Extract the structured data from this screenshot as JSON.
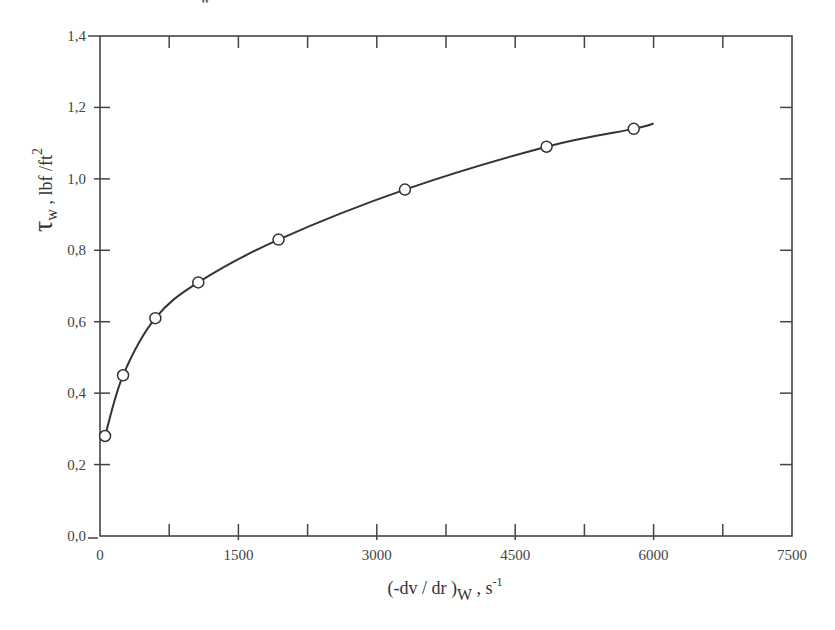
{
  "top_fragment": "w",
  "chart_data": {
    "type": "line",
    "title": "",
    "xlabel": "(-dv / dr )w , s-1",
    "xlabel_parts": {
      "main": "(-dv / dr )",
      "sub": "W",
      "sep": " , ",
      "unit": "s",
      "sup": "-1"
    },
    "ylabel": "τw , lbf /ft2",
    "ylabel_parts": {
      "main": "τ",
      "sub": "w",
      "rest": " , lbf /ft",
      "sup": "2"
    },
    "xlim": [
      0,
      7500
    ],
    "ylim": [
      0.0,
      1.4
    ],
    "x_ticks": [
      "0",
      "1500",
      "3000",
      "4500",
      "6000",
      "7500"
    ],
    "x_tick_values": [
      0,
      1500,
      3000,
      4500,
      6000,
      7500
    ],
    "x_minor_ticks": [
      750,
      2250,
      3750,
      5250,
      6750
    ],
    "y_ticks": [
      "0,0",
      "0,2",
      "0,4",
      "0,6",
      "0,8",
      "1,0",
      "1,2",
      "1,4"
    ],
    "y_tick_values": [
      0.0,
      0.2,
      0.4,
      0.6,
      0.8,
      1.0,
      1.2,
      1.4
    ],
    "grid": false,
    "legend": null,
    "series": [
      {
        "name": "measured",
        "marker": "open-circle",
        "x": [
          55,
          250,
          600,
          1065,
          1935,
          3305,
          4840,
          5785
        ],
        "y": [
          0.28,
          0.45,
          0.61,
          0.71,
          0.83,
          0.97,
          1.09,
          1.14
        ]
      }
    ],
    "fit_curve": {
      "name": "smooth fit",
      "x": [
        55,
        250,
        600,
        1065,
        1935,
        3305,
        4840,
        5785,
        6000
      ],
      "y": [
        0.28,
        0.45,
        0.61,
        0.71,
        0.83,
        0.97,
        1.09,
        1.14,
        1.155
      ]
    }
  }
}
